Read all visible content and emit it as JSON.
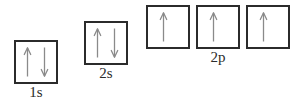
{
  "diagram": {
    "background_color": "#ffffff",
    "box_border_color": "#2b2b2b",
    "arrow_color": "#8a8a8a",
    "label_color": "#2c2c2c"
  },
  "orbitals": [
    {
      "id": "1s",
      "label": "1s",
      "electrons": 2,
      "boxes": [
        {
          "index": 0,
          "x": 14,
          "y": 40,
          "size": 44,
          "spins": [
            "up",
            "down"
          ]
        }
      ],
      "label_x": 14,
      "label_y": 85,
      "label_width": 44
    },
    {
      "id": "2s",
      "label": "2s",
      "electrons": 2,
      "boxes": [
        {
          "index": 0,
          "x": 84,
          "y": 21,
          "size": 44,
          "spins": [
            "up",
            "down"
          ]
        }
      ],
      "label_x": 84,
      "label_y": 66,
      "label_width": 44
    },
    {
      "id": "2p",
      "label": "2p",
      "electrons": 3,
      "boxes": [
        {
          "index": 0,
          "x": 146,
          "y": 5,
          "size": 44,
          "spins": [
            "up"
          ]
        },
        {
          "index": 1,
          "x": 196,
          "y": 5,
          "size": 44,
          "spins": [
            "up"
          ]
        },
        {
          "index": 2,
          "x": 246,
          "y": 5,
          "size": 44,
          "spins": [
            "up"
          ]
        }
      ],
      "label_x": 196,
      "label_y": 50,
      "label_width": 44
    }
  ],
  "labels": {
    "one_s": "1s",
    "two_s": "2s",
    "two_p": "2p"
  },
  "font": {
    "label_size_px": 15
  }
}
